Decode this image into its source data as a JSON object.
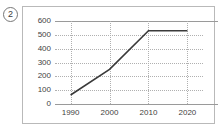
{
  "figure": {
    "index_label": "2"
  },
  "chart_data": {
    "type": "line",
    "title": "",
    "subtitle": "",
    "xlabel": "",
    "ylabel": "",
    "x": [
      1990,
      2000,
      2010,
      2020
    ],
    "xtick_labels": [
      "1990",
      "2000",
      "2010",
      "2020"
    ],
    "ytick_labels": [
      "0",
      "100",
      "200",
      "300",
      "400",
      "500",
      "600"
    ],
    "yticks": [
      0,
      100,
      200,
      300,
      400,
      500,
      600
    ],
    "ylim": [
      0,
      600
    ],
    "xlim": [
      1986,
      2024
    ],
    "grid": "dotted-both-axes",
    "legend": "none",
    "series": [
      {
        "name": "",
        "values": [
          65,
          250,
          530,
          530
        ],
        "color": "#3a3a3a"
      }
    ],
    "colors": {
      "line": "#3a3a3a",
      "gridline": "#b0b0b0",
      "axis": "#9a9a9a",
      "frame": "#b9b9b9",
      "text": "#3f3f3f",
      "background": "#ffffff"
    }
  }
}
